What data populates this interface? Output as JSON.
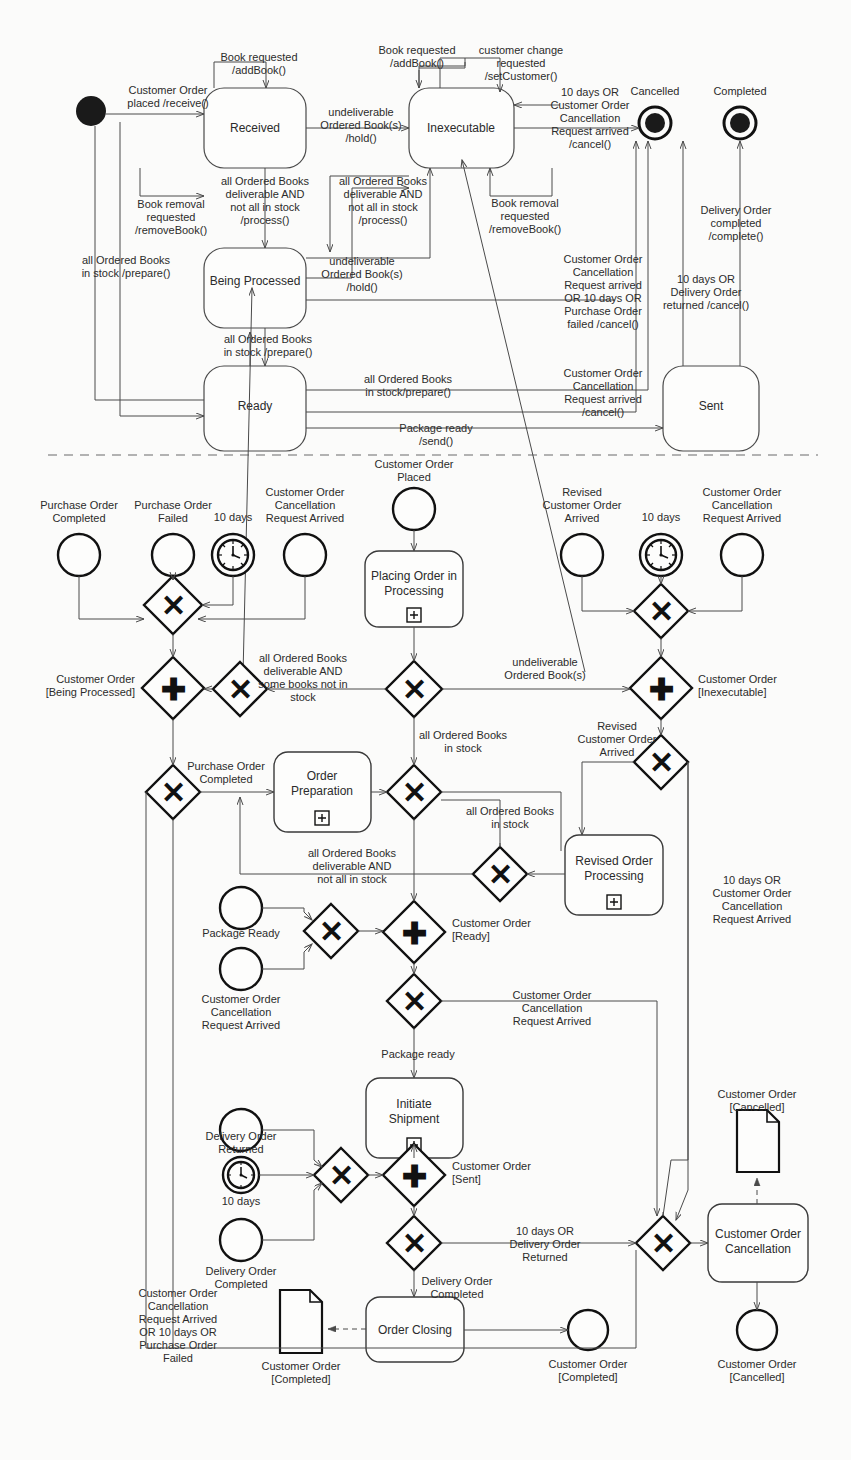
{
  "diagram": {
    "title_hidden": true,
    "sections": {
      "top": "UML state machine diagram for Customer Order",
      "bottom": "BPMN process diagram for Customer Order"
    }
  },
  "state_machine": {
    "initial_node": "initial-state",
    "states": [
      {
        "id": "received",
        "label": "Received"
      },
      {
        "id": "inexecutable",
        "label": "Inexecutable"
      },
      {
        "id": "being_processed",
        "label": "Being Processed"
      },
      {
        "id": "ready",
        "label": "Ready"
      },
      {
        "id": "sent",
        "label": "Sent"
      }
    ],
    "final_states": [
      {
        "id": "cancelled",
        "label": "Cancelled"
      },
      {
        "id": "completed",
        "label": "Completed"
      }
    ],
    "transitions": [
      {
        "id": "t1",
        "label": "Customer Order\nplaced /receive()"
      },
      {
        "id": "t2",
        "label": "Book requested\n/addBook()"
      },
      {
        "id": "t3",
        "label": "Book requested\n/addBook()"
      },
      {
        "id": "t4",
        "label": "customer change\nrequested\n/setCustomer()"
      },
      {
        "id": "t5",
        "label": "undeliverable\nOrdered Book(s)\n/hold()"
      },
      {
        "id": "t6",
        "label": "Book removal\nrequested\n/removeBook()"
      },
      {
        "id": "t7",
        "label": "all Ordered Books\ndeliverable AND\nnot all in stock\n/process()"
      },
      {
        "id": "t8",
        "label": "all Ordered Books\ndeliverable AND\nnot all in stock\n/process()"
      },
      {
        "id": "t9",
        "label": "Book removal\nrequested\n/removeBook()"
      },
      {
        "id": "t10",
        "label": "10 days OR\nCustomer Order\nCancellation\nRequest arrived\n/cancel()"
      },
      {
        "id": "t11",
        "label": "Delivery Order\ncompleted\n/complete()"
      },
      {
        "id": "t12",
        "label": "all Ordered Books\nin stock /prepare()"
      },
      {
        "id": "t13",
        "label": "undeliverable\nOrdered Book(s)\n/hold()"
      },
      {
        "id": "t14",
        "label": "all Ordered Books\nin stock /prepare()"
      },
      {
        "id": "t15",
        "label": "Customer Order\nCancellation\nRequest arrived\nOR 10 days OR\nPurchase Order\nfailed /cancel()"
      },
      {
        "id": "t16",
        "label": "10 days OR\nDelivery Order\nreturned /cancel()"
      },
      {
        "id": "t17",
        "label": "all Ordered Books\nin stock/prepare()"
      },
      {
        "id": "t18",
        "label": "Customer Order\nCancellation\nRequest arrived\n/cancel()"
      },
      {
        "id": "t19",
        "label": "Package ready\n/send()"
      }
    ]
  },
  "process": {
    "events": [
      {
        "id": "e_po_completed",
        "label": "Purchase Order\nCompleted",
        "type": "message-start"
      },
      {
        "id": "e_po_failed",
        "label": "Purchase Order\nFailed",
        "type": "message-start"
      },
      {
        "id": "e_timer_10d_1",
        "label": "10 days",
        "type": "timer"
      },
      {
        "id": "e_cocr_1",
        "label": "Customer Order\nCancellation\nRequest Arrived",
        "type": "message-start"
      },
      {
        "id": "e_co_placed",
        "label": "Customer Order\nPlaced",
        "type": "start"
      },
      {
        "id": "e_revised_co",
        "label": "Revised\nCustomer Order\nArrived",
        "type": "message-start"
      },
      {
        "id": "e_timer_10d_2",
        "label": "10 days",
        "type": "timer"
      },
      {
        "id": "e_cocr_2",
        "label": "Customer Order\nCancellation\nRequest Arrived",
        "type": "message-start"
      },
      {
        "id": "e_package_ready",
        "label": "Package Ready",
        "type": "message-start"
      },
      {
        "id": "e_cocr_3",
        "label": "Customer Order\nCancellation\nRequest Arrived",
        "type": "message-start"
      },
      {
        "id": "e_do_returned",
        "label": "Delivery Order\nReturned",
        "type": "message-start"
      },
      {
        "id": "e_timer_10d_3",
        "label": "10 days",
        "type": "timer"
      },
      {
        "id": "e_do_completed",
        "label": "Delivery Order\nCompleted",
        "type": "message-start"
      },
      {
        "id": "e_end_completed_1",
        "label": "Customer Order\n[Completed]",
        "type": "end"
      },
      {
        "id": "e_end_cancelled_1",
        "label": "Customer Order\n[Cancelled]",
        "type": "end"
      }
    ],
    "tasks": [
      {
        "id": "t_placing",
        "label": "Placing Order in\nProcessing",
        "marker": "subprocess"
      },
      {
        "id": "t_prep",
        "label": "Order\nPreparation",
        "marker": "subprocess"
      },
      {
        "id": "t_revised",
        "label": "Revised Order\nProcessing",
        "marker": "subprocess"
      },
      {
        "id": "t_initiate",
        "label": "Initiate\nShipment",
        "marker": "subprocess"
      },
      {
        "id": "t_closing",
        "label": "Order Closing",
        "marker": "none"
      },
      {
        "id": "t_cancellation",
        "label": "Customer Order\nCancellation",
        "marker": "none"
      }
    ],
    "data_objects": [
      {
        "id": "d_completed",
        "label": "Customer Order\n[Completed]"
      },
      {
        "id": "d_cancelled",
        "label": "Customer Order\n[Cancelled]"
      }
    ],
    "gateway_annotations": [
      {
        "id": "a_being_processed",
        "label": "Customer Order\n[Being Processed]"
      },
      {
        "id": "a_inexecutable",
        "label": "Customer Order\n[Inexecutable]"
      },
      {
        "id": "a_ready",
        "label": "Customer Order\n[Ready]"
      },
      {
        "id": "a_sent",
        "label": "Customer Order\n[Sent]"
      }
    ],
    "flow_labels": [
      {
        "id": "f1",
        "label": "all Ordered Books\ndeliverable AND\nsome books not in\nstock"
      },
      {
        "id": "f2",
        "label": "undeliverable\nOrdered Book(s)"
      },
      {
        "id": "f3",
        "label": "Purchase Order\nCompleted"
      },
      {
        "id": "f4",
        "label": "all Ordered Books\nin stock"
      },
      {
        "id": "f5",
        "label": "all Ordered Books\nin stock"
      },
      {
        "id": "f6",
        "label": "Revised\nCustomer Order\nArrived"
      },
      {
        "id": "f7",
        "label": "all Ordered Books\ndeliverable AND\nnot all in stock"
      },
      {
        "id": "f8",
        "label": "10 days OR\nCustomer Order\nCancellation\nRequest Arrived"
      },
      {
        "id": "f9",
        "label": "Customer Order\nCancellation\nRequest Arrived"
      },
      {
        "id": "f10",
        "label": "Package ready"
      },
      {
        "id": "f11",
        "label": "10 days OR\nDelivery Order\nReturned"
      },
      {
        "id": "f12",
        "label": "Delivery Order\nCompleted"
      },
      {
        "id": "f13",
        "label": "Customer Order\nCancellation\nRequest Arrived\nOR 10 days OR\nPurchase Order\nFailed"
      }
    ],
    "gateways": [
      {
        "id": "g1",
        "type": "xor"
      },
      {
        "id": "g2",
        "type": "and"
      },
      {
        "id": "g3",
        "type": "xor"
      },
      {
        "id": "g4",
        "type": "xor"
      },
      {
        "id": "g5",
        "type": "xor"
      },
      {
        "id": "g6",
        "type": "and"
      },
      {
        "id": "g7",
        "type": "xor"
      },
      {
        "id": "g8",
        "type": "xor"
      },
      {
        "id": "g9",
        "type": "xor"
      },
      {
        "id": "g10",
        "type": "xor"
      },
      {
        "id": "g11",
        "type": "xor"
      },
      {
        "id": "g12",
        "type": "and"
      },
      {
        "id": "g13",
        "type": "xor"
      },
      {
        "id": "g14",
        "type": "xor"
      },
      {
        "id": "g15",
        "type": "and"
      },
      {
        "id": "g16",
        "type": "xor"
      },
      {
        "id": "g17",
        "type": "xor"
      }
    ]
  },
  "glyphs": {
    "xor": "✕",
    "and": "✚",
    "subprocess": "⊞"
  }
}
